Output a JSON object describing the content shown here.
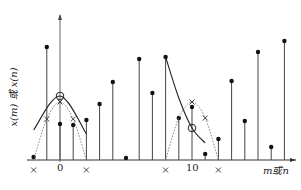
{
  "chart_data": {
    "type": "stem",
    "title": "",
    "xlabel": "m或n",
    "ylabel": "x(m) 或 x(n)",
    "x_tick_labels": [
      "0",
      "10"
    ],
    "x_ticks": [
      0,
      10
    ],
    "baseline_y_px": 160,
    "origin_x_px": 60,
    "unit_px": 13.2,
    "samples": {
      "x": [
        -2,
        -1,
        0,
        1,
        2,
        3,
        4,
        5,
        6,
        7,
        8,
        9,
        10,
        11,
        12,
        13,
        14,
        15,
        16,
        17
      ],
      "heights_px": [
        3,
        113,
        36,
        35,
        40,
        56,
        78,
        2,
        101,
        67,
        103,
        42,
        53,
        6,
        21,
        79,
        39,
        108,
        13,
        119
      ]
    },
    "curves": [
      {
        "name": "left-solid-parabola",
        "style": "solid",
        "points": [
          [
            -2,
            30
          ],
          [
            0,
            64
          ],
          [
            2,
            26
          ]
        ]
      },
      {
        "name": "left-dotted-window",
        "style": "dotted",
        "points": [
          [
            -2,
            0
          ],
          [
            -1,
            41
          ],
          [
            0,
            58
          ],
          [
            1,
            41
          ],
          [
            2,
            0
          ]
        ],
        "x_markers": [
          [
            -2,
            -10
          ],
          [
            -1,
            41
          ],
          [
            0,
            58
          ],
          [
            1,
            41
          ],
          [
            2,
            -10
          ]
        ]
      },
      {
        "name": "right-solid-curve",
        "style": "solid",
        "points": [
          [
            8,
            103
          ],
          [
            9,
            62
          ],
          [
            10,
            32
          ],
          [
            11,
            17
          ]
        ]
      },
      {
        "name": "right-dotted-window",
        "style": "dotted",
        "points": [
          [
            8,
            0
          ],
          [
            9,
            42
          ],
          [
            10,
            58
          ],
          [
            11,
            42
          ],
          [
            12,
            0
          ]
        ],
        "x_markers": [
          [
            8,
            -10
          ],
          [
            10,
            58
          ],
          [
            11,
            42
          ],
          [
            12,
            -10
          ]
        ]
      }
    ],
    "circle_markers": [
      [
        0,
        64
      ],
      [
        10,
        32
      ]
    ],
    "grid": false,
    "legend": null
  },
  "labels": {
    "ylabel": "x(m) 或 x(n)",
    "tick0": "0",
    "tick10": "10",
    "xlabel": "m或n"
  }
}
